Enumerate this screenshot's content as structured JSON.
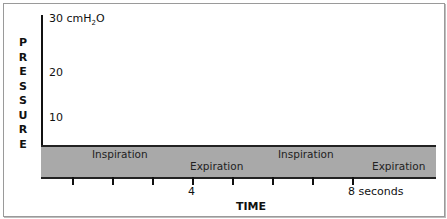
{
  "diagram": {
    "y_axis": {
      "title_letters": [
        "P",
        "R",
        "E",
        "S",
        "S",
        "U",
        "R",
        "E"
      ],
      "ticks": [
        {
          "label_main": "30 cmH",
          "sub": "2",
          "label_end": "O",
          "top": 12
        },
        {
          "label": "20",
          "top": 66
        },
        {
          "label": "10",
          "top": 111
        }
      ]
    },
    "x_axis": {
      "title": "TIME",
      "tick_positions": [
        72,
        112,
        152,
        192,
        232,
        272,
        312,
        352
      ],
      "labels": [
        {
          "label": "4",
          "left": 188
        },
        {
          "label": "8 seconds",
          "left": 348
        }
      ]
    },
    "phases": [
      {
        "label": "Inspiration",
        "left": 92,
        "top": 148
      },
      {
        "label": "Expiration",
        "left": 190,
        "top": 160
      },
      {
        "label": "Inspiration",
        "left": 278,
        "top": 148
      },
      {
        "label": "Expiration",
        "left": 372,
        "top": 160
      }
    ],
    "colors": {
      "band": "#a9a9a9",
      "axis": "#111111"
    }
  }
}
